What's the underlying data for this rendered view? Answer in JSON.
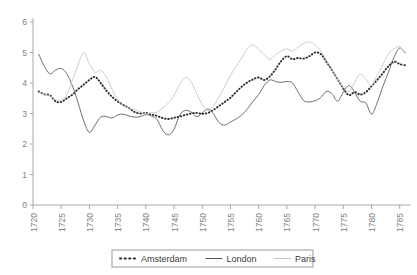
{
  "chart_data": {
    "type": "line",
    "title": "",
    "subtitle": "",
    "xlabel": "",
    "ylabel": "",
    "xlim": [
      1720,
      1787
    ],
    "ylim": [
      0,
      6
    ],
    "grid": false,
    "legend_position": "bottom",
    "x_tick_labels": [
      "1720",
      "1725",
      "1730",
      "1735",
      "1740",
      "1745",
      "1750",
      "1755",
      "1760",
      "1765",
      "1770",
      "1775",
      "1780",
      "1785"
    ],
    "x_tick_values": [
      1720,
      1725,
      1730,
      1735,
      1740,
      1745,
      1750,
      1755,
      1760,
      1765,
      1770,
      1775,
      1780,
      1785
    ],
    "x_tick_rotation": 90,
    "y_tick_labels": [
      "0",
      "1",
      "2",
      "3",
      "4",
      "5",
      "6"
    ],
    "y_tick_values": [
      0,
      1,
      2,
      3,
      4,
      5,
      6
    ],
    "series": [
      {
        "name": "Amsterdam",
        "style": "dotted",
        "color": "#2b2b2b",
        "x": [
          1721,
          1722,
          1723,
          1724,
          1725,
          1726,
          1727,
          1728,
          1729,
          1730,
          1731,
          1732,
          1733,
          1734,
          1735,
          1736,
          1737,
          1738,
          1739,
          1740,
          1741,
          1742,
          1743,
          1744,
          1745,
          1746,
          1747,
          1748,
          1749,
          1750,
          1751,
          1752,
          1753,
          1754,
          1755,
          1756,
          1757,
          1758,
          1759,
          1760,
          1761,
          1762,
          1763,
          1764,
          1765,
          1766,
          1767,
          1768,
          1769,
          1770,
          1771,
          1772,
          1773,
          1774,
          1775,
          1776,
          1777,
          1778,
          1779,
          1780,
          1781,
          1782,
          1783,
          1784,
          1785,
          1786
        ],
        "y": [
          3.72,
          3.63,
          3.6,
          3.4,
          3.38,
          3.5,
          3.62,
          3.8,
          3.95,
          4.1,
          4.2,
          4.0,
          3.75,
          3.55,
          3.4,
          3.28,
          3.18,
          3.05,
          3.0,
          3.02,
          2.97,
          2.92,
          2.85,
          2.82,
          2.86,
          2.9,
          2.95,
          3.0,
          3.02,
          2.99,
          3.02,
          3.12,
          3.25,
          3.38,
          3.52,
          3.7,
          3.88,
          4.02,
          4.12,
          4.18,
          4.1,
          4.22,
          4.45,
          4.72,
          4.88,
          4.78,
          4.82,
          4.8,
          4.88,
          5.0,
          4.95,
          4.7,
          4.42,
          4.12,
          3.82,
          3.6,
          3.7,
          3.62,
          3.7,
          3.9,
          4.1,
          4.32,
          4.55,
          4.7,
          4.62,
          4.58
        ]
      },
      {
        "name": "London",
        "style": "solid",
        "color": "#555555",
        "x": [
          1721,
          1722,
          1723,
          1724,
          1725,
          1726,
          1727,
          1728,
          1729,
          1730,
          1731,
          1732,
          1733,
          1734,
          1735,
          1736,
          1737,
          1738,
          1739,
          1740,
          1741,
          1742,
          1743,
          1744,
          1745,
          1746,
          1747,
          1748,
          1749,
          1750,
          1751,
          1752,
          1753,
          1754,
          1755,
          1756,
          1757,
          1758,
          1759,
          1760,
          1761,
          1762,
          1763,
          1764,
          1765,
          1766,
          1767,
          1768,
          1769,
          1770,
          1771,
          1772,
          1773,
          1774,
          1775,
          1776,
          1777,
          1778,
          1779,
          1780,
          1781,
          1782,
          1783,
          1784,
          1785,
          1786
        ],
        "y": [
          4.95,
          4.55,
          4.3,
          4.42,
          4.48,
          4.3,
          3.9,
          3.35,
          2.75,
          2.38,
          2.62,
          2.88,
          2.9,
          2.85,
          2.95,
          2.98,
          2.92,
          2.88,
          2.9,
          2.96,
          2.92,
          2.8,
          2.45,
          2.3,
          2.48,
          2.95,
          3.1,
          3.05,
          2.9,
          3.02,
          3.15,
          2.98,
          2.7,
          2.62,
          2.72,
          2.82,
          2.95,
          3.15,
          3.4,
          3.62,
          3.92,
          4.1,
          4.05,
          4.02,
          4.05,
          4.0,
          3.7,
          3.42,
          3.38,
          3.42,
          3.52,
          3.72,
          3.65,
          3.4,
          3.7,
          3.92,
          3.7,
          3.4,
          3.35,
          2.98,
          3.35,
          3.88,
          4.35,
          4.85,
          5.15,
          4.98
        ]
      },
      {
        "name": "Paris",
        "style": "solid-light",
        "color": "#c4c4c4",
        "x": [
          1721,
          1722,
          1723,
          1724,
          1725,
          1726,
          1727,
          1728,
          1729,
          1730,
          1731,
          1732,
          1733,
          1734,
          1735,
          1736,
          1737,
          1738,
          1739,
          1740,
          1741,
          1742,
          1743,
          1744,
          1745,
          1746,
          1747,
          1748,
          1749,
          1750,
          1751,
          1752,
          1753,
          1754,
          1755,
          1756,
          1757,
          1758,
          1759,
          1760,
          1761,
          1762,
          1763,
          1764,
          1765,
          1766,
          1767,
          1768,
          1769,
          1770,
          1771,
          1772,
          1773,
          1774,
          1775,
          1776,
          1777,
          1778,
          1779,
          1780,
          1781,
          1782,
          1783,
          1784,
          1785,
          1786
        ],
        "y": [
          3.7,
          3.62,
          3.58,
          3.45,
          3.42,
          3.62,
          4.1,
          4.6,
          5.0,
          4.62,
          4.35,
          4.42,
          4.2,
          3.8,
          3.45,
          3.25,
          3.18,
          3.12,
          3.05,
          3.0,
          3.02,
          3.05,
          3.18,
          3.35,
          3.6,
          3.95,
          4.18,
          4.05,
          3.65,
          3.3,
          3.1,
          3.25,
          3.55,
          3.9,
          4.25,
          4.55,
          4.82,
          5.12,
          5.25,
          5.1,
          4.92,
          4.78,
          4.92,
          5.05,
          5.12,
          5.05,
          5.18,
          5.3,
          5.35,
          5.25,
          5.05,
          4.75,
          4.45,
          4.12,
          3.85,
          3.72,
          4.02,
          4.3,
          4.12,
          3.92,
          4.25,
          4.6,
          4.95,
          5.12,
          5.2,
          4.95
        ]
      }
    ]
  },
  "legend": {
    "items": [
      {
        "label": "Amsterdam",
        "marker": "dotted",
        "color": "#2b2b2b"
      },
      {
        "label": "London",
        "marker": "solid",
        "color": "#555555"
      },
      {
        "label": "Paris",
        "marker": "solid-light",
        "color": "#c4c4c4"
      }
    ]
  },
  "axes": {
    "axis_color": "#a8a8a8",
    "tick_color": "#a8a8a8",
    "label_color": "#808080"
  }
}
